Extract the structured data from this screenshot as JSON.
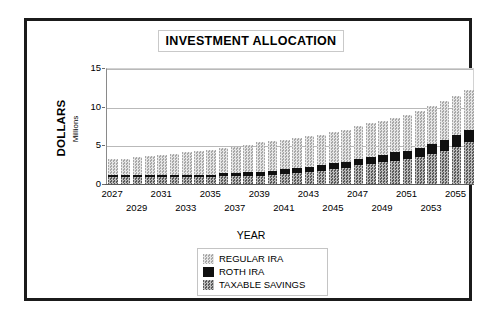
{
  "chart": {
    "title": "INVESTMENT ALLOCATION",
    "x_axis_title": "YEAR",
    "y_axis_title": "DOLLARS",
    "y_axis_units": "Millions"
  },
  "legend": {
    "items": [
      {
        "label": "REGULAR IRA",
        "swatch": "light-checker-swatch",
        "color": "#c2c2c2"
      },
      {
        "label": "ROTH IRA",
        "swatch": "solid-black-swatch",
        "color": "#101010"
      },
      {
        "label": "TAXABLE SAVINGS",
        "swatch": "dark-checker-swatch",
        "color": "#9a9a9a"
      }
    ]
  },
  "chart_data": {
    "type": "bar",
    "subtype": "stacked",
    "title": "INVESTMENT ALLOCATION",
    "xlabel": "YEAR",
    "ylabel": "DOLLARS",
    "yunits": "Millions",
    "ylim": [
      0,
      15
    ],
    "yticks": [
      0,
      5,
      10,
      15
    ],
    "ytick_labels": [
      "0",
      "5",
      "10",
      "15"
    ],
    "grid": true,
    "legend_position": "bottom-center",
    "categories": [
      "2027",
      "2028",
      "2029",
      "2030",
      "2031",
      "2032",
      "2033",
      "2034",
      "2035",
      "2036",
      "2037",
      "2038",
      "2039",
      "2040",
      "2041",
      "2042",
      "2043",
      "2044",
      "2045",
      "2046",
      "2047",
      "2048",
      "2049",
      "2050",
      "2051",
      "2052",
      "2053",
      "2054",
      "2055",
      "2056"
    ],
    "visible_xtick_labels": [
      "2027",
      "2029",
      "2031",
      "2033",
      "2035",
      "2037",
      "2039",
      "2041",
      "2043",
      "2045",
      "2047",
      "2049",
      "2051",
      "2053",
      "2055"
    ],
    "stack_order_bottom_to_top": [
      "TAXABLE SAVINGS",
      "ROTH IRA",
      "REGULAR IRA"
    ],
    "series": [
      {
        "name": "TAXABLE SAVINGS",
        "values": [
          0.9,
          0.9,
          0.9,
          0.9,
          0.9,
          0.9,
          0.9,
          0.9,
          0.9,
          1.0,
          1.0,
          1.1,
          1.1,
          1.2,
          1.3,
          1.4,
          1.5,
          1.7,
          1.9,
          2.1,
          2.4,
          2.6,
          2.8,
          3.0,
          3.2,
          3.5,
          3.9,
          4.3,
          4.8,
          5.4
        ]
      },
      {
        "name": "ROTH IRA",
        "values": [
          0.3,
          0.3,
          0.3,
          0.3,
          0.3,
          0.3,
          0.3,
          0.3,
          0.3,
          0.4,
          0.4,
          0.4,
          0.5,
          0.5,
          0.7,
          0.7,
          0.7,
          0.8,
          0.8,
          0.8,
          0.9,
          0.9,
          1.0,
          1.1,
          1.1,
          1.2,
          1.3,
          1.4,
          1.5,
          1.6
        ]
      },
      {
        "name": "REGULAR IRA",
        "values": [
          2.0,
          2.1,
          2.3,
          2.4,
          2.5,
          2.7,
          2.9,
          3.1,
          3.2,
          3.2,
          3.4,
          3.6,
          3.8,
          3.9,
          3.7,
          3.8,
          4.0,
          3.9,
          4.0,
          4.1,
          4.2,
          4.4,
          4.4,
          4.5,
          4.6,
          4.8,
          4.9,
          5.0,
          5.1,
          5.2
        ]
      }
    ],
    "totals": [
      3.2,
      3.3,
      3.5,
      3.6,
      3.7,
      3.9,
      4.1,
      4.3,
      4.4,
      4.6,
      4.8,
      5.1,
      5.4,
      5.6,
      5.7,
      5.9,
      6.2,
      6.4,
      6.7,
      7.0,
      7.5,
      7.9,
      8.2,
      8.6,
      8.9,
      9.5,
      10.1,
      10.7,
      11.4,
      12.2
    ]
  }
}
